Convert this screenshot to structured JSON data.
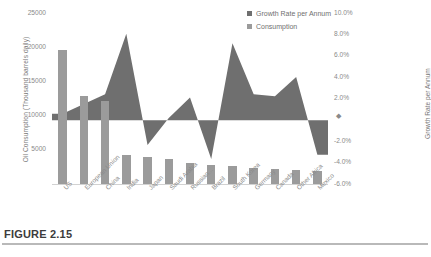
{
  "figure": {
    "caption": "FIGURE 2.15"
  },
  "chart_data": {
    "type": "bar",
    "title": "",
    "xlabel": "",
    "ylabel": "Oil Consumption (Thousand barrels daily)",
    "y2label": "Growth Rate per Annum",
    "ylim": [
      0,
      25000
    ],
    "y2lim": [
      -6,
      10
    ],
    "grid": false,
    "legend_position": "top-right",
    "categories": [
      "US",
      "European Union",
      "China",
      "India",
      "Japan",
      "Saudi Arabia",
      "Russian...",
      "Brazil",
      "South Korea",
      "Germany",
      "Canada",
      "Other Africa",
      "Mexico"
    ],
    "yticks": [
      "25000",
      "20000",
      "15000",
      "10000",
      "5000"
    ],
    "ytick_values": [
      25000,
      20000,
      15000,
      10000,
      5000
    ],
    "y2ticks": [
      "10.0%",
      "8.0%",
      "6.0%",
      "4.0%",
      "2.0%",
      "",
      "-2.0%",
      "-4.0%",
      "-6.0%"
    ],
    "y2tick_values": [
      10,
      8,
      6,
      4,
      2,
      0,
      -2,
      -4,
      -6
    ],
    "series": [
      {
        "name": "Growth Rate per Annum",
        "kind": "area",
        "axis": "secondary",
        "color": "#6f6f6f",
        "values": [
          0.6,
          1.5,
          2.4,
          8.0,
          -2.3,
          0.2,
          2.1,
          -3.6,
          7.1,
          2.4,
          2.2,
          4.0,
          -3.2
        ]
      },
      {
        "name": "Consumption",
        "kind": "bar",
        "axis": "primary",
        "color": "#9b9b9b",
        "values": [
          19500,
          12800,
          12200,
          4400,
          4000,
          3800,
          3200,
          2900,
          2700,
          2400,
          2350,
          2200,
          2050
        ]
      }
    ],
    "legend": [
      {
        "label": "Growth Rate per Annum",
        "color": "#6f6f6f"
      },
      {
        "label": "Consumption",
        "color": "#9b9b9b"
      }
    ],
    "zero_marker": "◆"
  }
}
